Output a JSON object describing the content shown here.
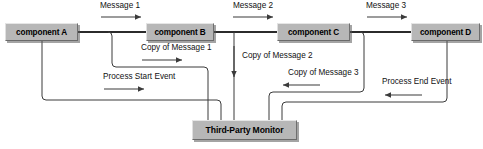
{
  "diagram": {
    "type": "component-interaction-diagram",
    "colors": {
      "node_fill": "#b7b7b7",
      "node_border_light": "#e6e6e6",
      "node_border_dark": "#6a6a6a",
      "connector": "#3b3b3b",
      "background": "#ffffff",
      "text": "#000000"
    },
    "nodes": [
      {
        "id": "component-a",
        "label": "component A",
        "x": 5,
        "y": 23,
        "w": 73,
        "h": 18,
        "font_size": 8.2
      },
      {
        "id": "component-b",
        "label": "component B",
        "x": 146,
        "y": 23,
        "w": 68,
        "h": 18,
        "font_size": 8.2
      },
      {
        "id": "component-c",
        "label": "component C",
        "x": 277,
        "y": 23,
        "w": 73,
        "h": 18,
        "font_size": 8.2
      },
      {
        "id": "component-d",
        "label": "component D",
        "x": 411,
        "y": 23,
        "w": 69,
        "h": 18,
        "font_size": 8.2
      },
      {
        "id": "third-party-monitor",
        "label": "Third-Party Monitor",
        "x": 192,
        "y": 120,
        "w": 105,
        "h": 20,
        "font_size": 8.6
      }
    ],
    "edge_labels": [
      {
        "id": "message-1",
        "text": "Message 1",
        "x": 100,
        "y": 2,
        "font_size": 8.2
      },
      {
        "id": "message-2",
        "text": "Message 2",
        "x": 233,
        "y": 2,
        "font_size": 8.2
      },
      {
        "id": "message-3",
        "text": "Message 3",
        "x": 366,
        "y": 2,
        "font_size": 8.2
      },
      {
        "id": "copy-of-message-1",
        "text": "Copy of Message 1",
        "x": 141,
        "y": 44,
        "font_size": 8.2
      },
      {
        "id": "copy-of-message-2",
        "text": "Copy of Message 2",
        "x": 242,
        "y": 52,
        "font_size": 8.2
      },
      {
        "id": "copy-of-message-3",
        "text": "Copy of Message 3",
        "x": 288,
        "y": 69,
        "font_size": 8.2
      },
      {
        "id": "process-start-event",
        "text": "Process Start Event",
        "x": 103,
        "y": 73,
        "font_size": 8.2
      },
      {
        "id": "process-end-event",
        "text": "Process End Event",
        "x": 382,
        "y": 78,
        "font_size": 8.2
      }
    ],
    "flows": [
      {
        "id": "flow-message-1",
        "from": "component-a",
        "to": "component-b",
        "label": "Message 1",
        "direction": "right"
      },
      {
        "id": "flow-message-2",
        "from": "component-b",
        "to": "component-c",
        "label": "Message 2",
        "direction": "right"
      },
      {
        "id": "flow-message-3",
        "from": "component-c",
        "to": "component-d",
        "label": "Message 3",
        "direction": "right"
      },
      {
        "id": "flow-copy-1",
        "from": "component-b",
        "to": "third-party-monitor",
        "label": "Copy of Message 1",
        "direction": "right"
      },
      {
        "id": "flow-copy-2",
        "from": "component-c",
        "to": "third-party-monitor",
        "label": "Copy of Message 2",
        "direction": "down"
      },
      {
        "id": "flow-copy-3",
        "from": "component-d",
        "to": "third-party-monitor",
        "label": "Copy of Message 3",
        "direction": "left"
      },
      {
        "id": "flow-start-event",
        "from": "component-a",
        "to": "third-party-monitor",
        "label": "Process Start Event",
        "direction": "right"
      },
      {
        "id": "flow-end-event",
        "from": "component-d",
        "to": "third-party-monitor",
        "label": "Process End Event",
        "direction": "left"
      }
    ]
  }
}
